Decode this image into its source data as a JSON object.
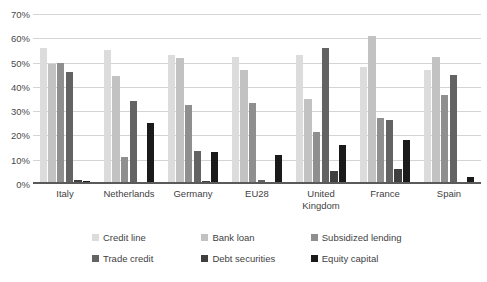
{
  "chart_data": {
    "type": "bar",
    "title": "",
    "subtitle": "",
    "xlabel": "",
    "ylabel": "",
    "ylim": [
      0,
      70
    ],
    "ytick_labels": [
      "0%",
      "10%",
      "20%",
      "30%",
      "40%",
      "50%",
      "60%",
      "70%"
    ],
    "ytick_values": [
      0,
      10,
      20,
      30,
      40,
      50,
      60,
      70
    ],
    "grid": "horizontal",
    "legend_position": "bottom",
    "categories": [
      "Italy",
      "Netherlands",
      "Germany",
      "EU28",
      "United Kingdom",
      "France",
      "Spain"
    ],
    "series": [
      {
        "name": "Credit line",
        "color": "#dcdcdc",
        "values": [
          56.0,
          55.0,
          53.0,
          52.5,
          53.0,
          48.0,
          47.0
        ]
      },
      {
        "name": "Bank loan",
        "color": "#c2c2c2",
        "values": [
          49.5,
          44.5,
          52.0,
          47.0,
          35.0,
          61.0,
          52.5
        ]
      },
      {
        "name": "Subsidized lending",
        "color": "#8f8f8f",
        "values": [
          50.0,
          11.0,
          32.5,
          33.5,
          21.5,
          27.0,
          36.5
        ]
      },
      {
        "name": "Trade credit",
        "color": "#636363",
        "values": [
          46.0,
          34.0,
          13.5,
          1.5,
          56.0,
          26.5,
          45.0
        ]
      },
      {
        "name": "Debt securities",
        "color": "#3f3f3f",
        "values": [
          1.5,
          1.0,
          1.3,
          0.8,
          5.5,
          6.0,
          0.8
        ]
      },
      {
        "name": "Equity capital",
        "color": "#1a1a1a",
        "values": [
          1.3,
          25.0,
          13.0,
          12.0,
          16.0,
          18.0,
          3.0
        ]
      }
    ]
  }
}
